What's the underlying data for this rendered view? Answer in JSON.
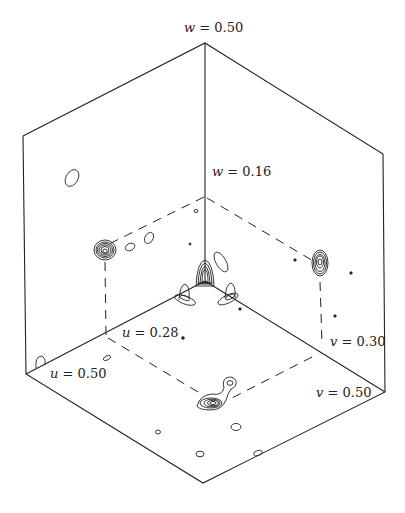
{
  "figure": {
    "type": "3D contour map (Patterson-style section box)",
    "axes": [
      "u",
      "v",
      "w"
    ],
    "labels": {
      "w_top": {
        "var": "w",
        "text": "= 0.50"
      },
      "w_inner": {
        "var": "w",
        "text": "= 0.16"
      },
      "u_inner": {
        "var": "u",
        "text": "= 0.28"
      },
      "u_outer": {
        "var": "u",
        "text": "= 0.50"
      },
      "v_inner": {
        "var": "v",
        "text": "= 0.30"
      },
      "v_outer": {
        "var": "v",
        "text": "= 0.50"
      }
    },
    "peaks": [
      {
        "name": "peak-origin",
        "description": "origin peak at box corner"
      },
      {
        "name": "peak-uw-plane",
        "description": "peak at u=0.28, w=0.16 on back-left wall"
      },
      {
        "name": "peak-vw-plane",
        "description": "peak at v=0.30, w=0.16 on back-right wall"
      },
      {
        "name": "peak-uv-plane",
        "description": "peak at u=0.28, v=0.30 on floor"
      }
    ],
    "line_color": "#222222",
    "background": "#ffffff"
  }
}
